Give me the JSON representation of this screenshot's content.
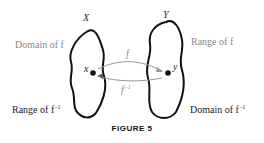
{
  "sets": {
    "left_title": "X",
    "right_title": "Y",
    "left_point": "x",
    "right_point": "y"
  },
  "labels": {
    "domain_f": "Domain of f",
    "range_f": "Range of f",
    "range_finv": "Range of f",
    "domain_finv": "Domain of f",
    "inv_sup": "−1"
  },
  "arrows": {
    "forward": "f",
    "inverse": "f",
    "inverse_sup": "−1"
  },
  "caption": "FIGURE 5",
  "colors": {
    "outline": "#111111",
    "gray_text": "#8a8a8a",
    "arrow": "#999999"
  }
}
